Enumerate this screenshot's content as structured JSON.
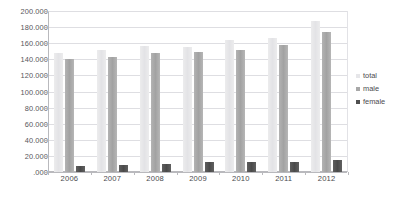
{
  "chart_data": {
    "type": "bar",
    "title": "",
    "subtitle": "",
    "xlabel": "",
    "ylabel": "",
    "categories": [
      "2006",
      "2007",
      "2008",
      "2009",
      "2010",
      "2011",
      "2012"
    ],
    "series": [
      {
        "name": "total",
        "color": "#e6e6e9",
        "values": [
          148000,
          151000,
          156000,
          155000,
          164000,
          166000,
          188000
        ]
      },
      {
        "name": "male",
        "color": "#a8a8a8",
        "values": [
          140000,
          143000,
          148000,
          149000,
          152000,
          158000,
          174000
        ]
      },
      {
        "name": "female",
        "color": "#4f4f4f",
        "values": [
          8000,
          8500,
          9500,
          13000,
          12500,
          12000,
          15000
        ]
      }
    ],
    "ylim": [
      0,
      200000
    ],
    "ytick_values": [
      0,
      20000,
      40000,
      60000,
      80000,
      100000,
      120000,
      140000,
      160000,
      180000,
      200000
    ],
    "ytick_labels": [
      ".000",
      "20.000",
      "40.000",
      "60.000",
      "80.000",
      "100.000",
      "120.000",
      "140.000",
      "160.000",
      "180.000",
      "200.000"
    ],
    "grid": true,
    "legend_position": "right",
    "legend": [
      {
        "label": "total",
        "color": "#e6e6e9"
      },
      {
        "label": "male",
        "color": "#a8a8a8"
      },
      {
        "label": "female",
        "color": "#4f4f4f"
      }
    ]
  }
}
